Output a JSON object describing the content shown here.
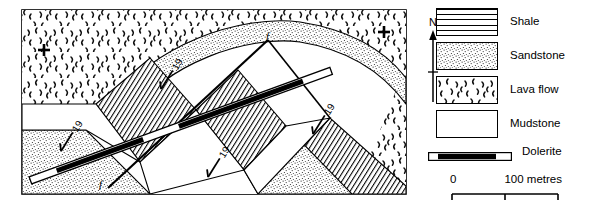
{
  "figure": {
    "type": "geological-map",
    "caption": ""
  },
  "map": {
    "name": "geological-map-area",
    "border_color": "#000000",
    "annotations": {
      "dip_symbols": [
        {
          "id": "dip-1",
          "value": "19",
          "x": 168,
          "y": 78,
          "rotation": -58
        },
        {
          "id": "dip-2",
          "value": "19",
          "x": 68,
          "y": 140,
          "rotation": -58
        },
        {
          "id": "dip-3",
          "value": "19",
          "x": 215,
          "y": 166,
          "rotation": -58
        },
        {
          "id": "dip-4",
          "value": "19",
          "x": 320,
          "y": 123,
          "rotation": -58
        }
      ],
      "fault_labels": [
        {
          "id": "fault-label-top",
          "text": "f",
          "x": 268,
          "y": 33
        },
        {
          "id": "fault-label-bottom",
          "text": "f",
          "x": 101,
          "y": 183
        }
      ],
      "outcrop_crosses": [
        {
          "id": "cross-left",
          "x": 44,
          "y": 50
        },
        {
          "id": "cross-right",
          "x": 384,
          "y": 32
        }
      ]
    }
  },
  "north_arrow": {
    "label": "N"
  },
  "legend": {
    "name": "map-legend",
    "items": [
      {
        "id": "legend-shale",
        "label": "Shale",
        "pattern": "horizontal-lines"
      },
      {
        "id": "legend-sandstone",
        "label": "Sandstone",
        "pattern": "stipple"
      },
      {
        "id": "legend-lavaflow",
        "label": "Lava flow",
        "pattern": "curved-dashes"
      },
      {
        "id": "legend-mudstone",
        "label": "Mudstone",
        "pattern": "blank"
      }
    ],
    "dolerite": {
      "id": "legend-dolerite",
      "label": "Dolerite",
      "pattern": "black-band-white-tips"
    }
  },
  "scale_bar": {
    "name": "scale-bar",
    "start_label": "0",
    "end_label": "100 metres",
    "ticks": 3
  }
}
